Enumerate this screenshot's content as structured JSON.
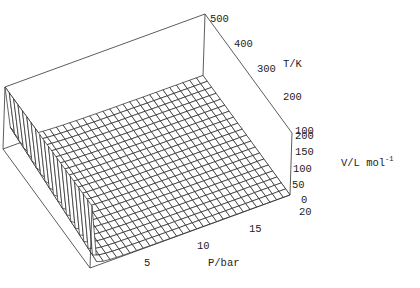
{
  "chart_data": {
    "type": "surface3d",
    "title": "",
    "function": "V = R*T/P (ideal gas), clipped at 200",
    "R": 0.08314,
    "x": {
      "label": "P/bar",
      "range": [
        0,
        20
      ],
      "ticks": [
        5,
        10,
        15,
        20
      ]
    },
    "y": {
      "label": "T/K",
      "range": [
        100,
        500
      ],
      "ticks": [
        100,
        200,
        300,
        400,
        500
      ]
    },
    "z": {
      "label": "V/L mol",
      "label_sup": "-1",
      "range": [
        0,
        200
      ],
      "ticks": [
        0,
        50,
        100,
        150,
        200
      ]
    },
    "mesh": {
      "p_lines": 30,
      "t_lines": 20
    },
    "grid": false,
    "box": true
  },
  "labels": {
    "p_axis": "P/bar",
    "t_axis": "T/K",
    "v_axis": "V/L mol",
    "v_axis_sup": "-1",
    "p_ticks": [
      "5",
      "10",
      "15",
      "20"
    ],
    "t_ticks": [
      "500",
      "400",
      "300",
      "200",
      "100"
    ],
    "v_ticks": [
      "200",
      "150",
      "100",
      "50",
      "0"
    ]
  },
  "colors": {
    "line": "#222222",
    "surface": "#ffffff",
    "background": "#ffffff"
  }
}
